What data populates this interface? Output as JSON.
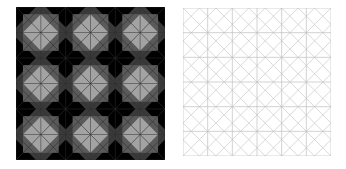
{
  "figure": {
    "left_panel": {
      "description": "Black background with 3x3 tiled grey diamonds",
      "rows": 3,
      "cols": 3,
      "colors": {
        "background": "#000000",
        "mid": "#5a5a5a",
        "dark_mid": "#3a3a3a",
        "diamond": "#a3a3a3",
        "line": "#2e2e2e"
      }
    },
    "right_panel": {
      "description": "White background with light grey diagonal and orthogonal line lattice",
      "colors": {
        "background": "#ffffff",
        "line": "#cfcfcf",
        "grid": "#bdbdbd"
      }
    }
  }
}
